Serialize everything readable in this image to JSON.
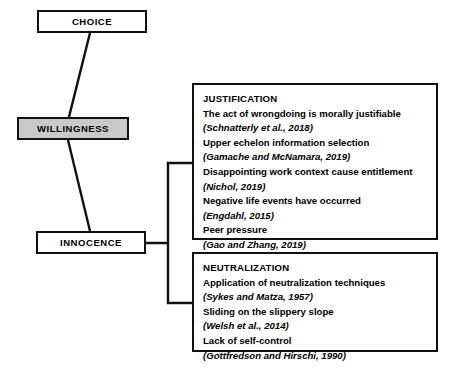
{
  "diagram": {
    "type": "flow-diagram",
    "colors": {
      "stroke": "#111111",
      "background": "#ffffff",
      "shaded_node_fill": "#c9c9c9"
    },
    "nodes": [
      {
        "id": "choice",
        "label": "CHOICE",
        "shaded": false
      },
      {
        "id": "willingness",
        "label": "WILLINGNESS",
        "shaded": true
      },
      {
        "id": "innocence",
        "label": "INNOCENCE",
        "shaded": false
      }
    ],
    "panels": [
      {
        "id": "justification",
        "title": "JUSTIFICATION",
        "items": [
          {
            "claim": "The act of wrongdoing is morally justifiable",
            "citation": "(Schnatterly et al., 2018)"
          },
          {
            "claim": "Upper echelon information selection",
            "citation": "(Gamache and McNamara, 2019)"
          },
          {
            "claim": "Disappointing work context cause entitlement",
            "citation": "(Nichol, 2019)"
          },
          {
            "claim": "Negative life events have occurred",
            "citation": "(Engdahl, 2015)"
          },
          {
            "claim": "Peer pressure",
            "citation": "(Gao and Zhang, 2019)"
          }
        ]
      },
      {
        "id": "neutralization",
        "title": "NEUTRALIZATION",
        "items": [
          {
            "claim": "Application of neutralization techniques",
            "citation": "(Sykes and Matza, 1957)"
          },
          {
            "claim": "Sliding on the slippery slope",
            "citation": "(Welsh et al., 2014)"
          },
          {
            "claim": "Lack of self-control",
            "citation": "(Gottfredson and Hirschi, 1990)"
          }
        ]
      }
    ],
    "connectors": [
      {
        "id": "choice-to-willingness",
        "from": "choice",
        "to": "willingness",
        "style": "diagonal-line"
      },
      {
        "id": "willingness-to-innocence",
        "from": "willingness",
        "to": "innocence",
        "style": "diagonal-line"
      },
      {
        "id": "innocence-to-panels",
        "from": "innocence",
        "to": "justification+neutralization",
        "style": "bracket"
      }
    ]
  }
}
